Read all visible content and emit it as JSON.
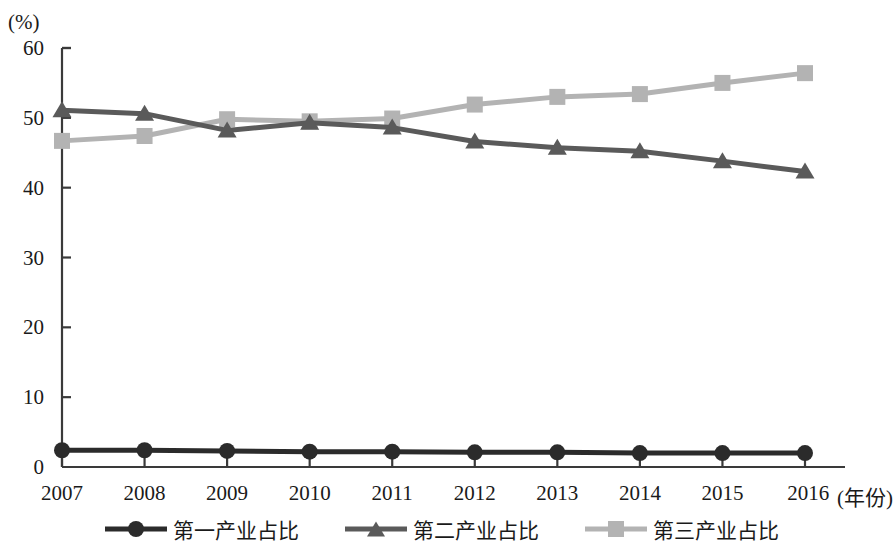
{
  "chart_data": {
    "type": "line",
    "title": "",
    "subtitle": "",
    "unit_label": "(%)",
    "xlabel": "(年份)",
    "ylabel": "",
    "grid": false,
    "legend_position": "bottom",
    "categories": [
      "2007",
      "2008",
      "2009",
      "2010",
      "2011",
      "2012",
      "2013",
      "2014",
      "2015",
      "2016"
    ],
    "x_tick_labels": [
      "2007",
      "2008",
      "2009",
      "2010",
      "2011",
      "2012",
      "2013",
      "2014",
      "2015",
      "2016"
    ],
    "y_tick_labels": [
      "0",
      "10",
      "20",
      "30",
      "40",
      "50",
      "60"
    ],
    "y_ticks": [
      0,
      10,
      20,
      30,
      40,
      50,
      60
    ],
    "ylim": [
      0,
      60
    ],
    "series": [
      {
        "name": "第一产业占比",
        "marker": "circle",
        "color": "#2b2b2b",
        "values": [
          2.4,
          2.4,
          2.3,
          2.2,
          2.2,
          2.1,
          2.1,
          2.0,
          2.0,
          2.0
        ]
      },
      {
        "name": "第二产业占比",
        "marker": "triangle",
        "color": "#5a5a5a",
        "values": [
          51.1,
          50.6,
          48.2,
          49.3,
          48.6,
          46.6,
          45.7,
          45.2,
          43.8,
          42.3
        ]
      },
      {
        "name": "第三产业占比",
        "marker": "square",
        "color": "#b3b3b3",
        "values": [
          46.7,
          47.4,
          49.8,
          49.5,
          49.9,
          51.9,
          53.0,
          53.4,
          55.0,
          56.4
        ]
      }
    ]
  },
  "legend": {
    "items": [
      {
        "label": "第一产业占比",
        "marker": "circle",
        "color": "#2b2b2b"
      },
      {
        "label": "第二产业占比",
        "marker": "triangle",
        "color": "#5a5a5a"
      },
      {
        "label": "第三产业占比",
        "marker": "square",
        "color": "#b3b3b3"
      }
    ]
  },
  "axes": {
    "unit_label": "(%)",
    "x_axis_title": "(年份)"
  }
}
